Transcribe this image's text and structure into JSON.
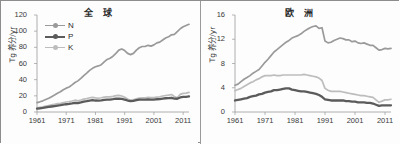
{
  "figure": {
    "ylabel": "Tg 养分/yr",
    "legend": [
      {
        "key": "N",
        "label": "N",
        "color": "#9a9a9a"
      },
      {
        "key": "P",
        "label": "P",
        "color": "#5b5b5b"
      },
      {
        "key": "K",
        "label": "K",
        "color": "#bdbdbd"
      }
    ]
  },
  "chart_data": [
    {
      "type": "line",
      "panel": "left",
      "title": "全 球",
      "xlabel": "",
      "ylabel": "Tg 养分/yr",
      "xlim": [
        1961,
        2013
      ],
      "ylim": [
        0,
        120
      ],
      "yticks": [
        0,
        20,
        40,
        60,
        80,
        100,
        120
      ],
      "xticks": [
        1961,
        1971,
        1981,
        1991,
        2001,
        2011
      ],
      "grid": false,
      "legend_position": "top-left",
      "x": [
        1961,
        1962,
        1963,
        1964,
        1965,
        1966,
        1967,
        1968,
        1969,
        1970,
        1971,
        1972,
        1973,
        1974,
        1975,
        1976,
        1977,
        1978,
        1979,
        1980,
        1981,
        1982,
        1983,
        1984,
        1985,
        1986,
        1987,
        1988,
        1989,
        1990,
        1991,
        1992,
        1993,
        1994,
        1995,
        1996,
        1997,
        1998,
        1999,
        2000,
        2001,
        2002,
        2003,
        2004,
        2005,
        2006,
        2007,
        2008,
        2009,
        2010,
        2011,
        2012,
        2013
      ],
      "series": [
        {
          "name": "N",
          "color": "#9a9a9a",
          "values": [
            11.6,
            12.6,
            13.8,
            15.4,
            17.0,
            19.0,
            21.0,
            23.2,
            25.0,
            27.5,
            29.5,
            31.0,
            33.5,
            36.5,
            38.5,
            41.5,
            45.0,
            48.0,
            51.5,
            54.0,
            56.0,
            57.0,
            58.5,
            62.0,
            65.0,
            66.5,
            69.0,
            72.5,
            76.5,
            78.0,
            76.0,
            72.5,
            71.0,
            72.5,
            76.5,
            79.5,
            81.0,
            81.0,
            82.5,
            81.5,
            83.0,
            85.5,
            86.5,
            89.0,
            91.5,
            93.0,
            95.5,
            96.0,
            99.5,
            103.0,
            105.5,
            107.0,
            108.5
          ]
        },
        {
          "name": "P",
          "color": "#5b5b5b",
          "values": [
            4.2,
            4.6,
            5.0,
            5.6,
            6.2,
            6.8,
            7.4,
            8.0,
            8.4,
            9.0,
            9.6,
            10.0,
            10.6,
            11.4,
            11.0,
            11.8,
            12.8,
            13.4,
            14.2,
            14.6,
            14.2,
            14.0,
            14.4,
            15.0,
            15.4,
            15.4,
            15.8,
            16.4,
            16.6,
            16.2,
            15.4,
            14.2,
            13.4,
            13.8,
            14.6,
            15.2,
            15.4,
            15.4,
            15.6,
            15.4,
            15.4,
            15.8,
            16.0,
            16.6,
            17.0,
            17.2,
            17.6,
            16.6,
            16.4,
            18.0,
            18.6,
            18.8,
            19.2
          ]
        },
        {
          "name": "K",
          "color": "#bdbdbd",
          "values": [
            5.2,
            5.8,
            6.4,
            7.2,
            8.0,
            8.8,
            9.6,
            10.4,
            10.8,
            11.6,
            12.4,
            12.8,
            13.6,
            14.6,
            13.8,
            14.8,
            16.0,
            16.6,
            17.6,
            18.0,
            17.4,
            17.0,
            17.6,
            18.4,
            18.8,
            18.8,
            19.4,
            20.2,
            20.6,
            19.8,
            18.2,
            16.0,
            14.6,
            15.2,
            16.4,
            17.2,
            17.6,
            17.6,
            18.0,
            17.8,
            17.8,
            18.4,
            18.8,
            19.8,
            20.4,
            20.8,
            21.6,
            19.2,
            17.6,
            21.8,
            23.0,
            23.4,
            24.2
          ]
        }
      ]
    },
    {
      "type": "line",
      "panel": "right",
      "title": "欧 洲",
      "xlabel": "",
      "ylabel": "Tg 养分/yr",
      "xlim": [
        1961,
        2013
      ],
      "ylim": [
        0,
        16
      ],
      "yticks": [
        0,
        4,
        8,
        12,
        16
      ],
      "xticks": [
        1961,
        1971,
        1981,
        1991,
        2001,
        2011
      ],
      "grid": false,
      "legend_position": "none",
      "x": [
        1961,
        1962,
        1963,
        1964,
        1965,
        1966,
        1967,
        1968,
        1969,
        1970,
        1971,
        1972,
        1973,
        1974,
        1975,
        1976,
        1977,
        1978,
        1979,
        1980,
        1981,
        1982,
        1983,
        1984,
        1985,
        1986,
        1987,
        1988,
        1989,
        1990,
        1991,
        1992,
        1993,
        1994,
        1995,
        1996,
        1997,
        1998,
        1999,
        2000,
        2001,
        2002,
        2003,
        2004,
        2005,
        2006,
        2007,
        2008,
        2009,
        2010,
        2011,
        2012,
        2013
      ],
      "series": [
        {
          "name": "N",
          "color": "#9a9a9a",
          "values": [
            4.4,
            4.6,
            5.0,
            5.4,
            5.7,
            6.0,
            6.4,
            6.7,
            7.0,
            7.6,
            8.2,
            8.7,
            9.3,
            9.9,
            10.3,
            10.7,
            11.1,
            11.5,
            11.8,
            12.2,
            12.4,
            12.6,
            12.9,
            13.3,
            13.6,
            13.9,
            14.1,
            14.2,
            13.8,
            13.9,
            11.7,
            11.4,
            11.5,
            11.8,
            12.0,
            12.2,
            12.1,
            11.9,
            11.9,
            11.6,
            11.7,
            11.4,
            11.3,
            11.4,
            11.2,
            11.0,
            11.0,
            10.6,
            10.2,
            10.3,
            10.5,
            10.4,
            10.5
          ]
        },
        {
          "name": "P",
          "color": "#5b5b5b",
          "values": [
            1.9,
            2.0,
            2.1,
            2.2,
            2.3,
            2.5,
            2.6,
            2.7,
            2.9,
            3.0,
            3.2,
            3.3,
            3.4,
            3.6,
            3.6,
            3.7,
            3.8,
            3.9,
            3.9,
            3.7,
            3.6,
            3.5,
            3.4,
            3.4,
            3.3,
            3.2,
            3.1,
            3.0,
            2.8,
            2.5,
            2.1,
            2.0,
            1.9,
            1.9,
            1.9,
            1.9,
            1.9,
            1.8,
            1.8,
            1.7,
            1.7,
            1.6,
            1.6,
            1.6,
            1.5,
            1.5,
            1.4,
            1.2,
            1.0,
            1.1,
            1.1,
            1.1,
            1.1
          ]
        },
        {
          "name": "K",
          "color": "#bdbdbd",
          "values": [
            3.5,
            3.7,
            3.9,
            4.2,
            4.5,
            4.8,
            5.0,
            5.3,
            5.5,
            5.8,
            6.0,
            6.0,
            6.0,
            6.1,
            6.0,
            6.0,
            6.1,
            6.1,
            6.1,
            6.1,
            6.1,
            6.1,
            6.1,
            6.2,
            6.1,
            6.0,
            5.9,
            5.8,
            5.6,
            5.2,
            3.9,
            3.6,
            3.4,
            3.4,
            3.4,
            3.4,
            3.3,
            3.2,
            3.1,
            3.0,
            2.9,
            2.8,
            2.7,
            2.7,
            2.6,
            2.5,
            2.4,
            2.0,
            1.6,
            1.8,
            2.0,
            2.0,
            2.1
          ]
        }
      ]
    }
  ]
}
